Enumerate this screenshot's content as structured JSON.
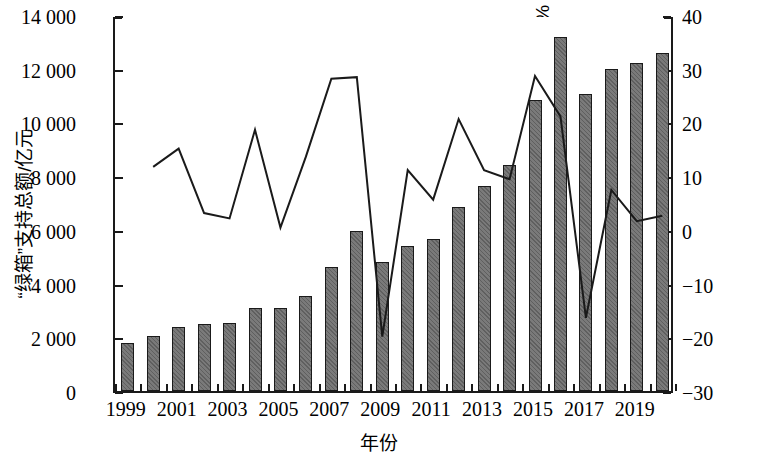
{
  "chart_data": {
    "type": "bar",
    "title": "",
    "xlabel": "年份",
    "ylabel": "“绿箱”支持总额/亿元",
    "y2label": "年均增长率/%",
    "grid": false,
    "legend": "none",
    "ylim": [
      0,
      14000
    ],
    "y2lim": [
      -30,
      40
    ],
    "ytick_labels": [
      "14 000",
      "12 000",
      "10 000",
      "8 000",
      "6 000",
      "4 000",
      "2 000",
      "0"
    ],
    "ytick_values": [
      14000,
      12000,
      10000,
      8000,
      6000,
      4000,
      2000,
      0
    ],
    "y2tick_labels": [
      "40",
      "30",
      "20",
      "10",
      "0",
      "−10",
      "−20",
      "−30"
    ],
    "y2tick_values": [
      40,
      30,
      20,
      10,
      0,
      -10,
      -20,
      -30
    ],
    "xtick_labels": [
      "1999",
      "2001",
      "2003",
      "2005",
      "2007",
      "2009",
      "2011",
      "2013",
      "2015",
      "2017",
      "2019"
    ],
    "xtick_values": [
      1999,
      2001,
      2003,
      2005,
      2007,
      2009,
      2011,
      2013,
      2015,
      2017,
      2019
    ],
    "categories": [
      1999,
      2000,
      2001,
      2002,
      2003,
      2004,
      2005,
      2006,
      2007,
      2008,
      2009,
      2010,
      2011,
      2012,
      2013,
      2014,
      2015,
      2016,
      2017,
      2018,
      2019,
      2020
    ],
    "series": [
      {
        "name": "“绿箱”支持总额/亿元",
        "type": "bar",
        "axis": "left",
        "values": [
          1800,
          2050,
          2400,
          2500,
          2550,
          3100,
          3100,
          3550,
          4600,
          5950,
          4800,
          5400,
          5650,
          6850,
          7650,
          8400,
          10850,
          13200,
          11050,
          12000,
          12200,
          12600
        ]
      },
      {
        "name": "年均增长率/%",
        "type": "line",
        "axis": "right",
        "values": [
          null,
          12.1,
          15.5,
          3.5,
          2.5,
          19.0,
          0.8,
          14.0,
          28.5,
          28.8,
          -19.5,
          11.5,
          6.0,
          21.0,
          11.5,
          9.8,
          29.0,
          21.5,
          -16.0,
          7.8,
          2.0,
          3.0
        ]
      }
    ]
  },
  "axes": {
    "left_title": "“绿箱”支持总额/亿元",
    "right_title": "年均增长率/%",
    "x_title": "年份"
  }
}
